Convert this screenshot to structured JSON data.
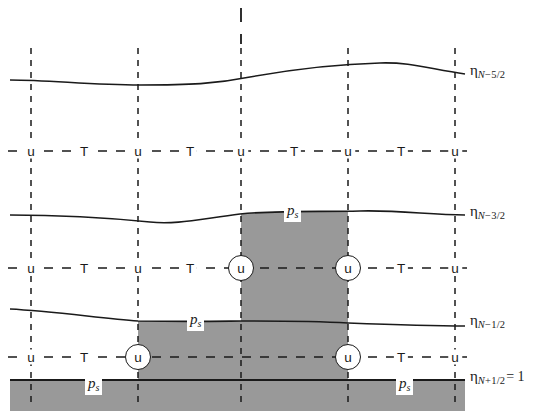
{
  "figure": {
    "background_color": "#ffffff",
    "shade_color": "#999999",
    "line_color": "#1a1a1a",
    "width": 554,
    "height": 411
  },
  "level_labels": [
    {
      "id": "eta-n-5-2",
      "eta": "η",
      "sub_main": "N",
      "sub_rest": "−5/2",
      "equals": "",
      "x": 470,
      "y": 72
    },
    {
      "id": "eta-n-3-2",
      "eta": "η",
      "sub_main": "N",
      "sub_rest": "−3/2",
      "equals": "",
      "x": 470,
      "y": 213
    },
    {
      "id": "eta-n-1-2",
      "eta": "η",
      "sub_main": "N",
      "sub_rest": "−1/2",
      "equals": "",
      "x": 470,
      "y": 322
    },
    {
      "id": "eta-n1-2",
      "eta": "η",
      "sub_main": "N",
      "sub_rest": "+1/2",
      "equals": "= 1",
      "x": 470,
      "y": 378
    }
  ],
  "ps_labels": [
    {
      "id": "ps-upper-column",
      "text": "p",
      "sub": "s",
      "x": 284,
      "y": 213
    },
    {
      "id": "ps-mid-layer",
      "text": "p",
      "sub": "s",
      "x": 187,
      "y": 322
    },
    {
      "id": "ps-bottom-left",
      "text": "p",
      "sub": "s",
      "x": 85,
      "y": 386
    },
    {
      "id": "ps-bottom-right",
      "text": "p",
      "sub": "s",
      "x": 396,
      "y": 386
    }
  ],
  "columns": {
    "x_positions": [
      31,
      138,
      241,
      348,
      455
    ],
    "label": "vertical dashed grid column lines"
  },
  "rows": {
    "u_rows_y": [
      151,
      268,
      357
    ],
    "label": "horizontal dashed u/T rows"
  },
  "u_points_plain": [
    {
      "x": 31,
      "y": 151,
      "text": "u"
    },
    {
      "x": 138,
      "y": 151,
      "text": "u"
    },
    {
      "x": 241,
      "y": 151,
      "text": "u"
    },
    {
      "x": 348,
      "y": 151,
      "text": "u"
    },
    {
      "x": 455,
      "y": 151,
      "text": "u"
    },
    {
      "x": 31,
      "y": 268,
      "text": "u"
    },
    {
      "x": 138,
      "y": 268,
      "text": "u"
    },
    {
      "x": 455,
      "y": 268,
      "text": "u"
    },
    {
      "x": 31,
      "y": 357,
      "text": "u"
    },
    {
      "x": 455,
      "y": 357,
      "text": "u"
    }
  ],
  "u_points_circled": [
    {
      "x": 241,
      "y": 268,
      "text": "u"
    },
    {
      "x": 348,
      "y": 268,
      "text": "u"
    },
    {
      "x": 138,
      "y": 357,
      "text": "u"
    },
    {
      "x": 348,
      "y": 357,
      "text": "u"
    }
  ],
  "t_points": [
    {
      "x": 84,
      "y": 151,
      "text": "T"
    },
    {
      "x": 190,
      "y": 151,
      "text": "T"
    },
    {
      "x": 294,
      "y": 151,
      "text": "T"
    },
    {
      "x": 401,
      "y": 151,
      "text": "T"
    },
    {
      "x": 84,
      "y": 268,
      "text": "T"
    },
    {
      "x": 190,
      "y": 268,
      "text": "T"
    },
    {
      "x": 401,
      "y": 268,
      "text": "T"
    },
    {
      "x": 84,
      "y": 357,
      "text": "T"
    },
    {
      "x": 401,
      "y": 357,
      "text": "T"
    }
  ],
  "curves": {
    "eta_n_5_2": "M 10,80 C 50,80 90,85 140,85 C 190,85 215,84 250,77 C 300,68 340,64 380,63 C 410,62 430,69 465,74",
    "eta_n_3_2": "M 10,215 C 60,215 110,218 150,222 C 175,225 200,219 240,214 C 280,210 320,212 360,211 C 400,210 430,215 465,215",
    "eta_n_1_2": "M 10,309 C 50,311 100,318 138,321 C 200,322 230,321 241,321 C 300,321 330,322 348,323 C 400,325 430,326 465,326",
    "eta_n1_2": "M 10,380 L 465,380"
  },
  "shaded_regions": [
    {
      "id": "shade-upper-column",
      "x0": 241,
      "x1": 348,
      "description": "column between eta_N-3/2 and eta_N-1/2"
    },
    {
      "id": "shade-mid-layer",
      "x0": 138,
      "x1": 348,
      "description": "layer between eta_N-1/2 and eta_N+1/2"
    },
    {
      "id": "shade-bottom-band",
      "x0": 10,
      "x1": 465,
      "description": "surface band below eta_N+1/2 = 1"
    }
  ],
  "top_tick": {
    "x": 241,
    "y0": 8,
    "y1": 44,
    "label": "vertical axis tick above top level"
  }
}
